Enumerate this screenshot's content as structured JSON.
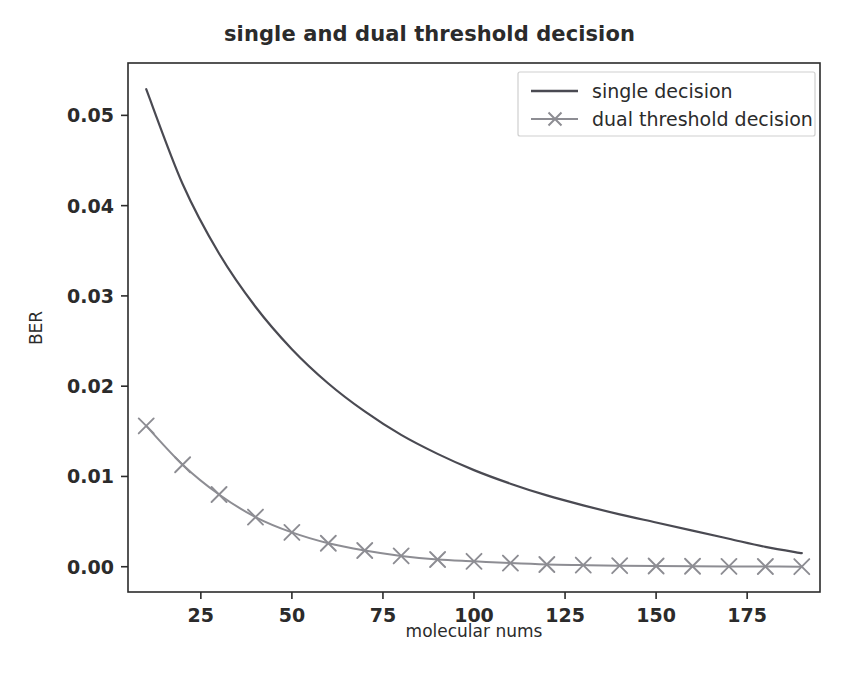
{
  "chart_data": {
    "type": "line",
    "title": "single and dual threshold decision",
    "xlabel": "molecular nums",
    "ylabel": "BER",
    "xlim": [
      5,
      195
    ],
    "ylim": [
      -0.0028,
      0.0558
    ],
    "xticks": [
      25,
      50,
      75,
      100,
      125,
      150,
      175
    ],
    "xticklabels": [
      "25",
      "50",
      "75",
      "100",
      "125",
      "150",
      "175"
    ],
    "yticks": [
      0.0,
      0.01,
      0.02,
      0.03,
      0.04,
      0.05
    ],
    "yticklabels": [
      "0.00",
      "0.01",
      "0.02",
      "0.03",
      "0.04",
      "0.05"
    ],
    "grid": false,
    "legend_position": "upper right",
    "x": [
      10,
      20,
      30,
      40,
      50,
      60,
      70,
      80,
      90,
      100,
      110,
      120,
      130,
      140,
      150,
      160,
      170,
      180,
      190
    ],
    "series": [
      {
        "name": "single decision",
        "color": "#4a4a52",
        "marker": "none",
        "linewidth": 2.2,
        "values": [
          0.0529,
          0.0424,
          0.0347,
          0.0288,
          0.0241,
          0.0203,
          0.0172,
          0.0146,
          0.0125,
          0.0107,
          0.0092,
          0.0079,
          0.0068,
          0.0058,
          0.0049,
          0.004,
          0.0031,
          0.0022,
          0.0015
        ]
      },
      {
        "name": "dual threshold decision",
        "color": "#8d8d93",
        "marker": "x",
        "linewidth": 2.0,
        "values": [
          0.0156,
          0.0113,
          0.008,
          0.0055,
          0.0038,
          0.0026,
          0.0018,
          0.0012,
          0.0008,
          0.0006,
          0.0004,
          0.00025,
          0.00018,
          0.00012,
          8e-05,
          5e-05,
          3e-05,
          2e-05,
          1e-05
        ]
      }
    ]
  },
  "legend": {
    "entries": [
      {
        "label": "single decision"
      },
      {
        "label": "dual threshold decision"
      }
    ]
  },
  "axes": {
    "spine_color": "#2b2b2b",
    "background": "#ffffff"
  }
}
